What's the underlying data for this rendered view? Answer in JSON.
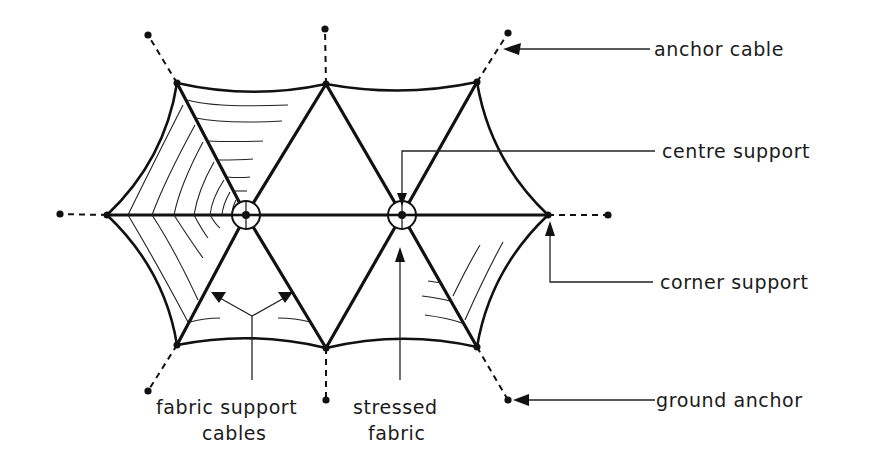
{
  "diagram": {
    "type": "tensile fabric roof plan (hexagonal, two centre supports)",
    "labels": {
      "anchor_cable": "anchor cable",
      "centre_support": "centre support",
      "corner_support": "corner support",
      "ground_anchor": "ground anchor",
      "fabric_support_line1": "fabric support",
      "fabric_support_line2": "cables",
      "stressed_fabric_line1": "stressed",
      "stressed_fabric_line2": "fabric"
    },
    "nodes": {
      "centre_supports": [
        [
          246,
          215
        ],
        [
          402,
          215
        ]
      ],
      "corner_supports": [
        [
          107,
          215
        ],
        [
          177,
          83
        ],
        [
          326,
          84
        ],
        [
          477,
          82
        ],
        [
          548,
          215
        ],
        [
          477,
          347
        ],
        [
          326,
          348
        ],
        [
          177,
          345
        ]
      ],
      "ground_anchors": [
        [
          60,
          214
        ],
        [
          148,
          35
        ],
        [
          325,
          29
        ],
        [
          508,
          33
        ],
        [
          608,
          215
        ],
        [
          508,
          400
        ],
        [
          326,
          400
        ],
        [
          148,
          391
        ]
      ]
    },
    "colors": {
      "line": "#111111",
      "background": "#ffffff"
    }
  }
}
